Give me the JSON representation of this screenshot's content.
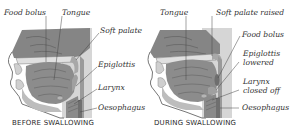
{
  "before": {
    "caption": "BEFORE SWALLOWING",
    "labels": {
      "food_bolus": "Food bolus",
      "tongue": "Tongue",
      "soft_palate": "Soft palate",
      "epiglottis": "Epiglottis",
      "larynx": "Larynx",
      "oesophagus": "Oesophagus"
    }
  },
  "during": {
    "caption": "DURING SWALLOWING",
    "labels": {
      "tongue": "Tongue",
      "soft_palate_raised": "Soft palate raised",
      "food_bolus": "Food bolus",
      "epiglottis_lowered_1": "Epiglottis",
      "epiglottis_lowered_2": "lowered",
      "larynx_closed_1": "Larynx",
      "larynx_closed_2": "closed off",
      "oesophagus": "Oesophagus"
    }
  },
  "colors": {
    "tissue_dark": "#7d7d7d",
    "tissue_mid": "#9a9a9a",
    "tissue_light": "#c8c8c8",
    "background_box": "#d9d9d9",
    "line": "#444444"
  }
}
